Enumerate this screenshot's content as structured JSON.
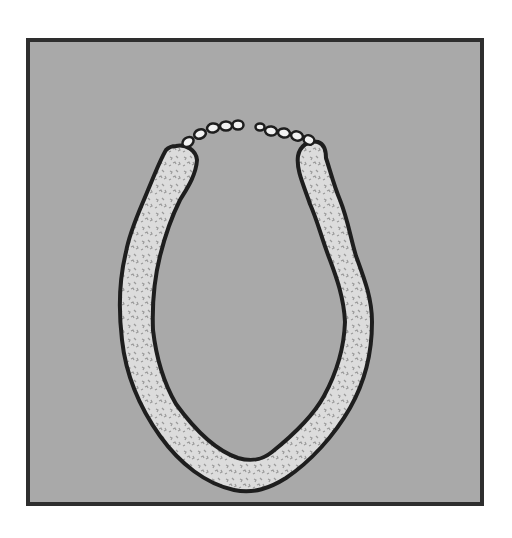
{
  "figure": {
    "colors": {
      "background": "#ffffff",
      "panel_fill": "#a9a9a9",
      "panel_border": "#2e2e2e",
      "ring_fill": "#dcdcdc",
      "ring_outline": "#1e1e1e",
      "speckle": "#9a9a9a",
      "bead_fill": "#f2f2f2"
    },
    "panel": {
      "x": 26,
      "y": 38,
      "width": 458,
      "height": 468
    },
    "ring": {
      "gap_top_center_x": 255,
      "gap_top_y": 130,
      "bottom_y": 492,
      "left_x": 120,
      "right_x": 372
    },
    "beads_left_count": 5,
    "beads_right_count": 5
  }
}
